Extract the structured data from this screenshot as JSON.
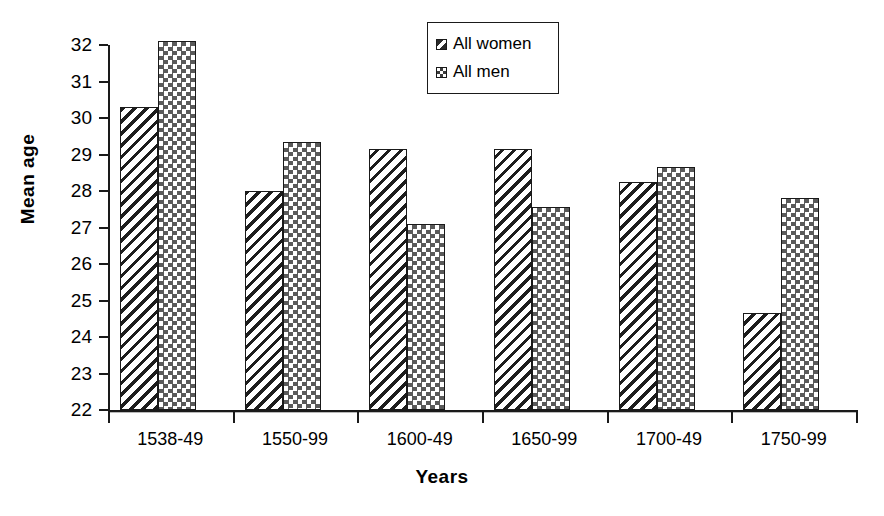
{
  "chart_data": {
    "type": "bar",
    "title": "",
    "xlabel": "Years",
    "ylabel": "Mean age",
    "categories": [
      "1538-49",
      "1550-99",
      "1600-49",
      "1650-99",
      "1700-49",
      "1750-99"
    ],
    "series": [
      {
        "name": "All women",
        "pattern": "diagonal-hatch",
        "values": [
          30.3,
          28.0,
          29.15,
          29.15,
          28.25,
          24.65
        ]
      },
      {
        "name": "All men",
        "pattern": "checkerboard",
        "values": [
          32.1,
          29.35,
          27.1,
          27.55,
          28.65,
          27.8
        ]
      }
    ],
    "ylim": [
      22,
      32
    ],
    "ytick_step": 1,
    "ytick_labels": [
      "32",
      "31",
      "30",
      "29",
      "28",
      "27",
      "26",
      "25",
      "24",
      "23",
      "22"
    ],
    "grid": false,
    "legend_position": "top-center"
  },
  "legend": {
    "items": [
      {
        "label": "All women",
        "swatch": "diagonal-hatch-swatch"
      },
      {
        "label": "All men",
        "swatch": "checkerboard-swatch"
      }
    ]
  }
}
